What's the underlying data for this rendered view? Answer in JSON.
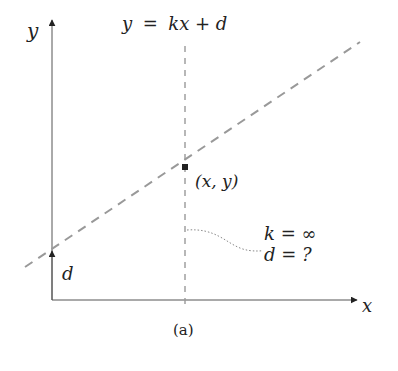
{
  "diagram": {
    "caption": "(a)",
    "axes": {
      "x_label": "x",
      "y_label": "y"
    },
    "line_equation": {
      "lhs": "y",
      "eq": "=",
      "rhs": "kx + d"
    },
    "point_label": "(x, y)",
    "intercept_label": "d",
    "annotation": {
      "line1": "k = ∞",
      "line2": "d = ?"
    },
    "colors": {
      "axis": "#555555",
      "dashed_line": "#999999",
      "point": "#222222",
      "text": "#222222"
    }
  }
}
